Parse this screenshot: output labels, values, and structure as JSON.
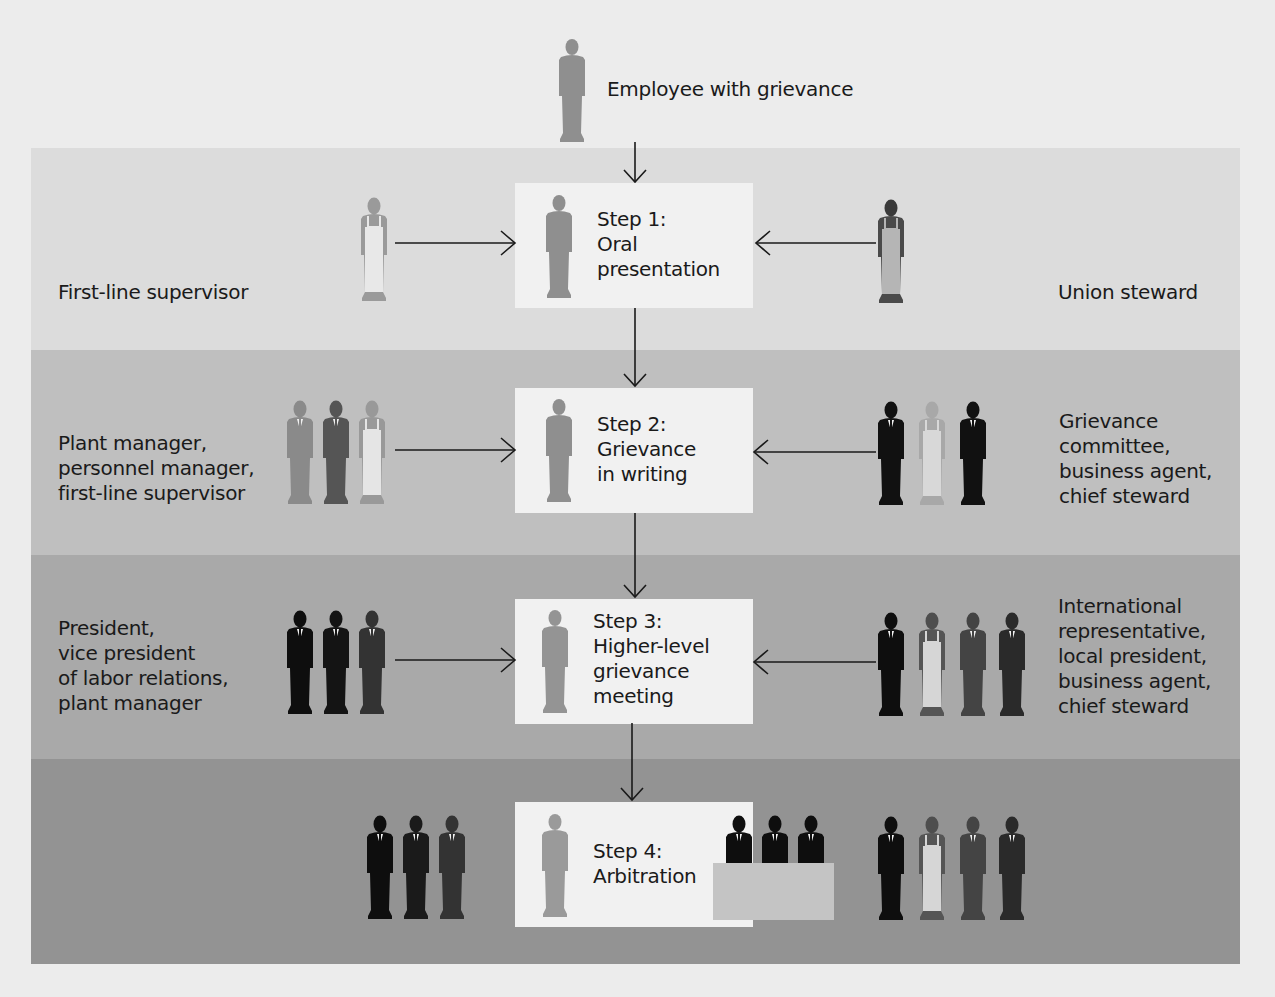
{
  "top": {
    "employee_label": "Employee with grievance",
    "employee_figure": "employee-figure-icon"
  },
  "steps": [
    {
      "number": 1,
      "text": "Step 1:\nOral\npresentation",
      "left_label": "First-line supervisor",
      "right_label": "Union steward",
      "left_figures": [
        "worker-apron-light"
      ],
      "right_figures": [
        "worker-apron-dark"
      ]
    },
    {
      "number": 2,
      "text": "Step 2:\nGrievance\nin writing",
      "left_label": "Plant manager,\npersonnel manager,\nfirst-line supervisor",
      "right_label": "Grievance\ncommittee,\nbusiness agent,\nchief steward",
      "left_figures": [
        "suit-gray",
        "suit-darkgray",
        "worker-apron-light"
      ],
      "right_figures": [
        "suit-black",
        "worker-apron-light",
        "suit-black"
      ]
    },
    {
      "number": 3,
      "text": "Step 3:\nHigher-level\ngrievance\nmeeting",
      "left_label": "President,\nvice president\nof labor relations,\nplant manager",
      "right_label": "International\nrepresentative,\nlocal president,\nbusiness agent,\nchief steward",
      "left_figures": [
        "suit-black",
        "suit-black",
        "suit-darkgray"
      ],
      "right_figures": [
        "suit-black",
        "worker-apron-dark",
        "suit-darkgray",
        "suit-darkgray"
      ]
    },
    {
      "number": 4,
      "text": "Step 4:\nArbitration",
      "left_label": "",
      "right_label": "",
      "left_figures": [
        "suit-black",
        "suit-black",
        "suit-darkgray"
      ],
      "right_figures": [
        "suit-black",
        "worker-apron-dark",
        "suit-darkgray",
        "suit-darkgray"
      ],
      "arbitrators": [
        "suit-black",
        "suit-black",
        "suit-black"
      ]
    }
  ],
  "colors": {
    "page_bg": "#ececec",
    "band_1": "#dcdcdc",
    "band_2": "#bfbfbf",
    "band_3": "#a9a9a9",
    "band_4": "#939393",
    "step_box": "#f1f1f1",
    "employee_figure": "#8f8f8f",
    "arrow": "#1a1a1a"
  }
}
